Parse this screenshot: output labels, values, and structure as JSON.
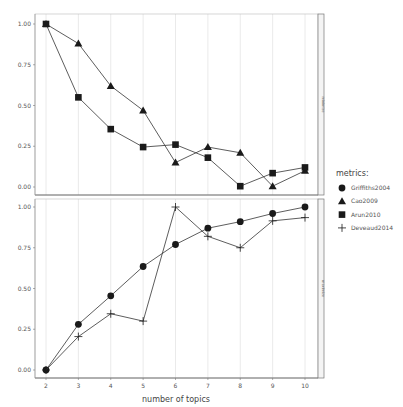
{
  "chart_data": {
    "type": "line",
    "title": "",
    "xlabel": "number of topics",
    "ylabel": "",
    "x": [
      2,
      3,
      4,
      5,
      6,
      7,
      8,
      9,
      10
    ],
    "x_ticks": [
      "2",
      "3",
      "4",
      "5",
      "6",
      "7",
      "8",
      "9",
      "10"
    ],
    "y_ticks": [
      "0.00",
      "0.25",
      "0.50",
      "0.75",
      "1.00"
    ],
    "ylim": [
      0,
      1
    ],
    "grid": "vertical",
    "legend": {
      "title": "metrics:",
      "position": "right",
      "entries": [
        {
          "name": "Griffiths2004",
          "shape": "circle"
        },
        {
          "name": "Cao2009",
          "shape": "triangle"
        },
        {
          "name": "Arun2010",
          "shape": "square"
        },
        {
          "name": "Deveaud2014",
          "shape": "plus"
        }
      ]
    },
    "panels": [
      {
        "strip": "minimize",
        "series": [
          {
            "name": "Cao2009",
            "shape": "triangle",
            "values": [
              1.0,
              0.88,
              0.62,
              0.47,
              0.15,
              0.245,
              0.21,
              0.005,
              0.1
            ]
          },
          {
            "name": "Arun2010",
            "shape": "square",
            "values": [
              1.0,
              0.55,
              0.355,
              0.245,
              0.26,
              0.18,
              0.005,
              0.085,
              0.12
            ]
          }
        ]
      },
      {
        "strip": "maximize",
        "series": [
          {
            "name": "Griffiths2004",
            "shape": "circle",
            "values": [
              0.0,
              0.28,
              0.455,
              0.635,
              0.77,
              0.87,
              0.91,
              0.96,
              1.0
            ]
          },
          {
            "name": "Deveaud2014",
            "shape": "plus",
            "values": [
              0.0,
              0.205,
              0.345,
              0.3,
              1.0,
              0.82,
              0.75,
              0.915,
              0.935
            ]
          }
        ]
      }
    ]
  },
  "colors": {
    "line": "#333333",
    "marker": "#1a1a1a",
    "grid": "#e4e4e4",
    "panel_border": "#888888",
    "text": "#555555"
  }
}
